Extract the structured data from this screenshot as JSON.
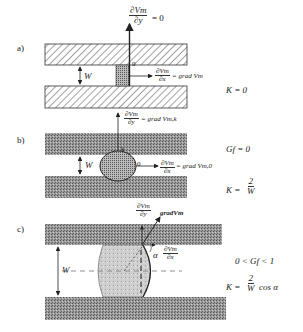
{
  "panels": [
    {
      "id": "a",
      "label": "a)",
      "gradient_top": {
        "numerator": "∂Vm",
        "denominator": "∂y",
        "rhs": "= 0"
      },
      "gradient_right": {
        "numerator": "∂Vm",
        "denominator": "∂x",
        "rhs": "= grad Vm"
      },
      "gap_label": "W",
      "condition": "K = 0",
      "small_marker": "0"
    },
    {
      "id": "b",
      "label": "b)",
      "gradient_top": {
        "numerator": "∂Vm",
        "denominator": "∂y",
        "rhs": "= grad Vm,k"
      },
      "gradient_right": {
        "numerator": "∂Vm",
        "denominator": "∂x",
        "rhs": "= grad Vm,0"
      },
      "gap_label": "W",
      "point_labels": [
        "k",
        "0"
      ],
      "condition_1": "Gf = 0",
      "condition_2": {
        "lhs": "K =",
        "numerator": "2",
        "denominator": "W"
      }
    },
    {
      "id": "c",
      "label": "c)",
      "gradient_top": {
        "numerator": "∂Vm",
        "denominator": "∂y"
      },
      "gradient_vector": "gradVm",
      "gradient_right": {
        "numerator": "∂Vm",
        "denominator": "∂x"
      },
      "angle": "α",
      "gap_label": "W",
      "condition_1": "0 < Gf < 1",
      "condition_2": {
        "lhs": "K =",
        "numerator": "2",
        "denominator": "W",
        "suffix": "cos α"
      }
    }
  ],
  "colors": {
    "plate": "#8a8a8a",
    "plate_dark": "#555555",
    "liquid": "#bdbdbd",
    "line": "#222222"
  }
}
